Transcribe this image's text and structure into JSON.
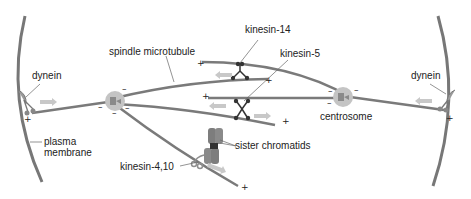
{
  "labels": {
    "spindle_microtubule": "spindle microtubule",
    "kinesin_14": "kinesin-14",
    "kinesin_5": "kinesin-5",
    "dynein_left": "dynein",
    "dynein_right": "dynein",
    "plasma_membrane_line1": "plasma",
    "plasma_membrane_line2": "membrane",
    "centrosome": "centrosome",
    "kinesin_4_10": "kinesin-4,10",
    "sister_chromatids": "sister chromatids"
  },
  "signs": {
    "plus": "+",
    "minus": "–"
  },
  "colors": {
    "microtubule": "#7a7a7a",
    "membrane": "#777777",
    "centrosome": "#bdbdbd",
    "motor": "#333333",
    "arrow": "#c8c8c8",
    "chromatid": "#808080",
    "leader": "#555555"
  }
}
